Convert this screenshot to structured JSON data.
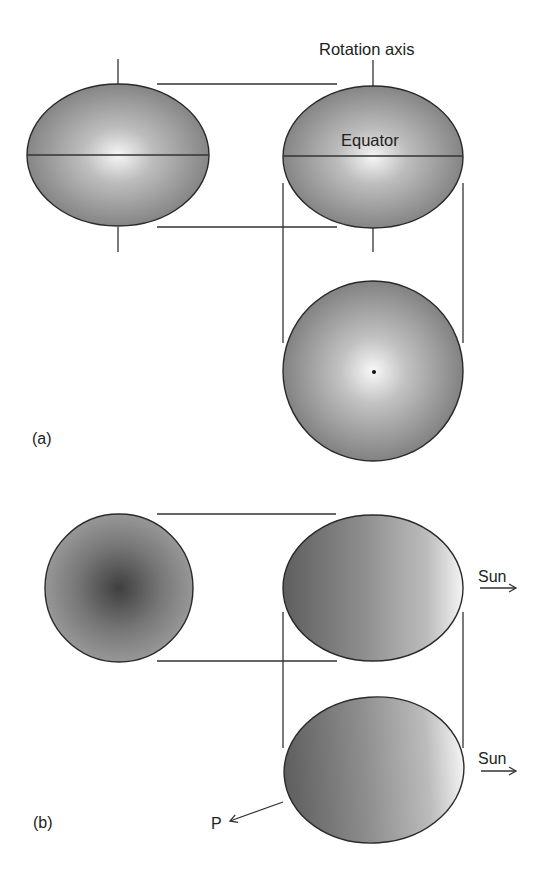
{
  "figure": {
    "panel_a": {
      "label": "(a)",
      "rotation_axis_label": "Rotation axis",
      "equator_label": "Equator",
      "views": [
        {
          "name": "side-view-left",
          "shape": "oblate ellipse",
          "cx": 118,
          "cy": 155,
          "rx": 91,
          "ry": 71,
          "shading": "radial, bright center"
        },
        {
          "name": "side-view-right",
          "shape": "oblate ellipse",
          "cx": 373,
          "cy": 157,
          "rx": 90,
          "ry": 71,
          "shading": "radial, bright center"
        },
        {
          "name": "pole-on-view",
          "shape": "circle",
          "cx": 373,
          "cy": 371,
          "r": 90,
          "shading": "radial, bright center",
          "center_dot": true
        }
      ]
    },
    "panel_b": {
      "label": "(b)",
      "sun_label_1": "Sun",
      "sun_label_2": "Sun",
      "p_label": "P",
      "views": [
        {
          "name": "circle-dark-center",
          "shape": "circle",
          "cx": 119,
          "cy": 588,
          "r": 74,
          "shading": "radial, dark center"
        },
        {
          "name": "ellipse-lit-right",
          "shape": "ellipse",
          "cx": 373,
          "cy": 588,
          "rx": 90,
          "ry": 73,
          "shading": "linear, dark left to light right"
        },
        {
          "name": "ellipse-lit-right-lower",
          "shape": "ellipse",
          "cx": 374,
          "cy": 770,
          "rx": 90,
          "ry": 73,
          "shading": "linear, dark left to light right"
        }
      ]
    },
    "colors": {
      "background": "#ffffff",
      "line": "#333333",
      "shade_dark": "#6e6e6e",
      "shade_mid": "#9a9a9a",
      "shade_light": "#f4f4f4",
      "text": "#222222"
    }
  }
}
